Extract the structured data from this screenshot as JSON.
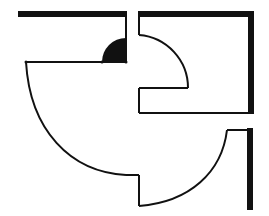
{
  "diagram": {
    "title": "",
    "colors": {
      "background": "#ffffff",
      "stroke": "#111111"
    },
    "elements": [
      {
        "name": "top-left-wall",
        "type": "thick-wall"
      },
      {
        "name": "top-left-door-swing-small",
        "type": "filled-quarter-circle"
      },
      {
        "name": "large-door-swing-arc",
        "type": "arc"
      },
      {
        "name": "top-right-wall",
        "type": "thick-wall"
      },
      {
        "name": "top-right-door-swing",
        "type": "arc"
      },
      {
        "name": "bottom-right-wall",
        "type": "thick-wall"
      },
      {
        "name": "bottom-right-door-swing",
        "type": "arc"
      }
    ]
  }
}
